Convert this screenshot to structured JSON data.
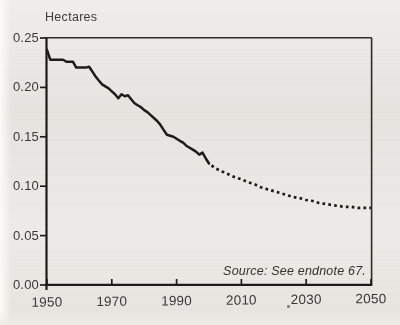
{
  "figure": {
    "unit_label": "Hectares",
    "source_note": "Source: See endnote 67."
  },
  "chart_data": {
    "type": "line",
    "title": "",
    "xlabel": "",
    "ylabel": "Hectares",
    "x_range": [
      1950,
      2050
    ],
    "y_range": [
      0,
      0.25
    ],
    "x_ticks": [
      1950,
      1970,
      1990,
      2010,
      2030,
      2050
    ],
    "y_ticks": [
      "0.00",
      "0.05",
      "0.10",
      "0.15",
      "0.20",
      "0.25"
    ],
    "grid": false,
    "legend": "none",
    "frame": "full-box",
    "line_color": "#1c1c1c",
    "background_color": "#e9e7e2",
    "source": "Source: See endnote 67.",
    "series": [
      {
        "name": "historical",
        "style": "solid",
        "points": [
          [
            1950,
            0.238
          ],
          [
            1951,
            0.228
          ],
          [
            1952,
            0.228
          ],
          [
            1953,
            0.228
          ],
          [
            1954,
            0.228
          ],
          [
            1955,
            0.228
          ],
          [
            1956,
            0.226
          ],
          [
            1957,
            0.226
          ],
          [
            1958,
            0.226
          ],
          [
            1959,
            0.22
          ],
          [
            1960,
            0.22
          ],
          [
            1961,
            0.22
          ],
          [
            1962,
            0.22
          ],
          [
            1963,
            0.221
          ],
          [
            1964,
            0.216
          ],
          [
            1965,
            0.211
          ],
          [
            1966,
            0.207
          ],
          [
            1967,
            0.203
          ],
          [
            1968,
            0.201
          ],
          [
            1969,
            0.199
          ],
          [
            1970,
            0.196
          ],
          [
            1971,
            0.193
          ],
          [
            1972,
            0.189
          ],
          [
            1973,
            0.193
          ],
          [
            1974,
            0.191
          ],
          [
            1975,
            0.192
          ],
          [
            1976,
            0.188
          ],
          [
            1977,
            0.184
          ],
          [
            1978,
            0.182
          ],
          [
            1979,
            0.18
          ],
          [
            1980,
            0.177
          ],
          [
            1981,
            0.175
          ],
          [
            1982,
            0.172
          ],
          [
            1983,
            0.169
          ],
          [
            1984,
            0.166
          ],
          [
            1985,
            0.162
          ],
          [
            1986,
            0.157
          ],
          [
            1987,
            0.152
          ],
          [
            1988,
            0.151
          ],
          [
            1989,
            0.15
          ],
          [
            1990,
            0.148
          ],
          [
            1991,
            0.146
          ],
          [
            1992,
            0.144
          ],
          [
            1993,
            0.141
          ],
          [
            1994,
            0.139
          ],
          [
            1995,
            0.137
          ],
          [
            1996,
            0.135
          ],
          [
            1997,
            0.132
          ],
          [
            1998,
            0.134
          ],
          [
            1999,
            0.128
          ],
          [
            2000,
            0.123
          ]
        ]
      },
      {
        "name": "projection",
        "style": "dotted",
        "points": [
          [
            2000,
            0.123
          ],
          [
            2002,
            0.118
          ],
          [
            2004,
            0.115
          ],
          [
            2006,
            0.112
          ],
          [
            2008,
            0.109
          ],
          [
            2010,
            0.107
          ],
          [
            2012,
            0.104
          ],
          [
            2014,
            0.102
          ],
          [
            2016,
            0.099
          ],
          [
            2018,
            0.097
          ],
          [
            2020,
            0.095
          ],
          [
            2022,
            0.093
          ],
          [
            2024,
            0.091
          ],
          [
            2026,
            0.089
          ],
          [
            2028,
            0.088
          ],
          [
            2030,
            0.086
          ],
          [
            2032,
            0.085
          ],
          [
            2034,
            0.083
          ],
          [
            2036,
            0.082
          ],
          [
            2038,
            0.081
          ],
          [
            2040,
            0.08
          ],
          [
            2042,
            0.079
          ],
          [
            2044,
            0.079
          ],
          [
            2046,
            0.078
          ],
          [
            2048,
            0.078
          ],
          [
            2050,
            0.078
          ]
        ]
      }
    ]
  }
}
